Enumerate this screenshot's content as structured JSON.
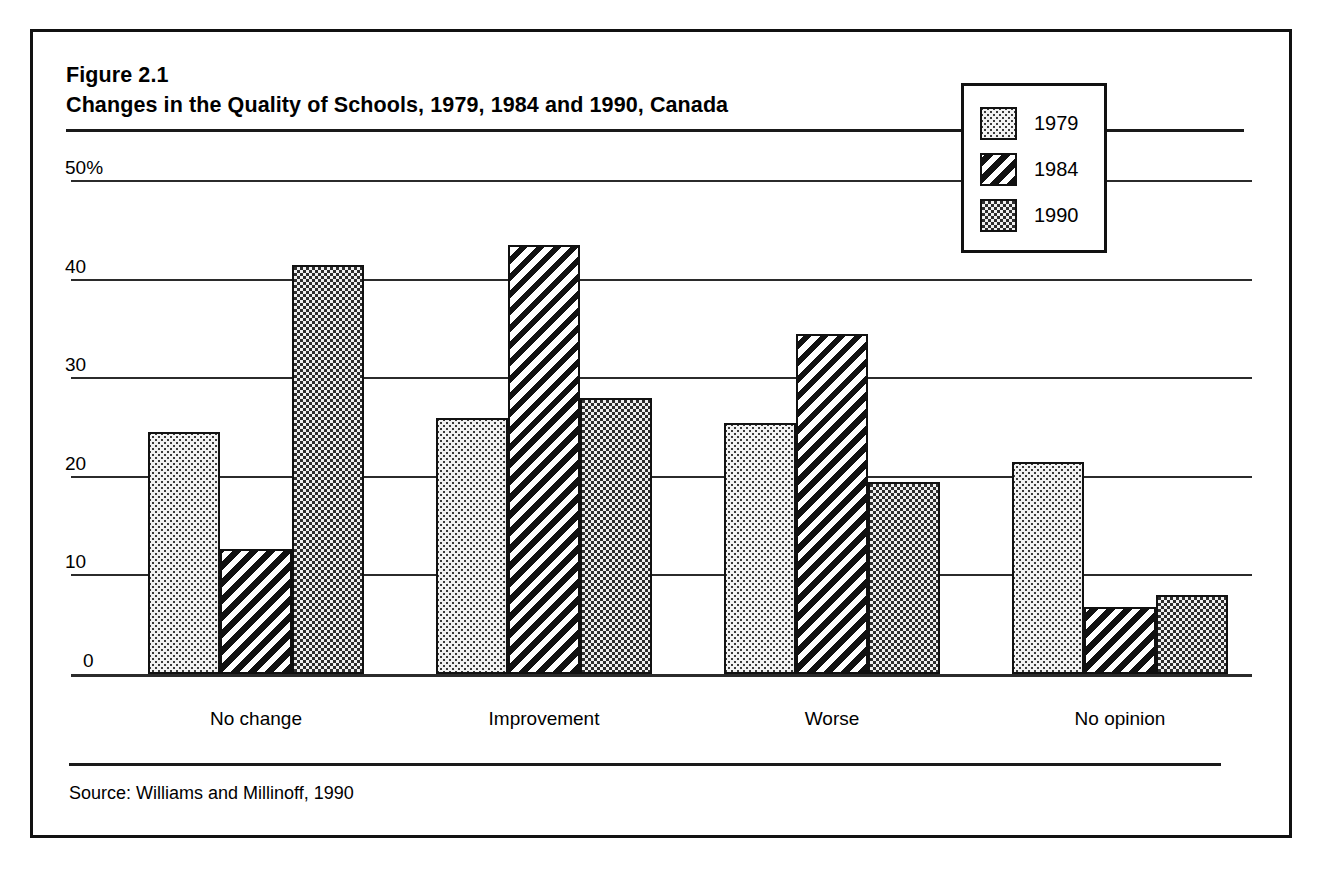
{
  "figure": {
    "number_label": "Figure 2.1",
    "title": "Changes in the Quality of Schools, 1979, 1984 and 1990, Canada",
    "source": "Source: Williams and Millinoff, 1990"
  },
  "legend": {
    "position": "inside-top-right",
    "entries": [
      {
        "label": "1979",
        "pattern": "light-dots"
      },
      {
        "label": "1984",
        "pattern": "diagonal-hatch"
      },
      {
        "label": "1990",
        "pattern": "dark-checker"
      }
    ]
  },
  "axis": {
    "y_ticks": [
      "50%",
      "40",
      "30",
      "20",
      "10",
      "0"
    ],
    "y_tick_values": [
      50,
      40,
      30,
      20,
      10,
      0
    ],
    "x_categories": [
      "No change",
      "Improvement",
      "Worse",
      "No opinion"
    ]
  },
  "chart_data": {
    "type": "bar",
    "title": "Changes in the Quality of Schools, 1979, 1984 and 1990, Canada",
    "xlabel": "",
    "ylabel": "",
    "ylim": [
      0,
      50
    ],
    "ytick_labels": [
      "0",
      "10",
      "20",
      "30",
      "40",
      "50%"
    ],
    "yticks": [
      0,
      10,
      20,
      30,
      40,
      50
    ],
    "grid": true,
    "legend_position": "upper right",
    "categories": [
      "No change",
      "Improvement",
      "Worse",
      "No opinion"
    ],
    "series": [
      {
        "name": "1979",
        "pattern": "light-dots",
        "values": [
          24.5,
          26.0,
          25.5,
          21.5
        ]
      },
      {
        "name": "1984",
        "pattern": "diagonal-hatch",
        "values": [
          12.7,
          43.5,
          34.5,
          6.8
        ]
      },
      {
        "name": "1990",
        "pattern": "dark-checker",
        "values": [
          41.5,
          28.0,
          19.5,
          8.0
        ]
      }
    ],
    "units": "percent",
    "source": "Williams and Millinoff, 1990"
  },
  "colors": {
    "frame": "#111111",
    "gridline": "#2b2b2b",
    "text": "#000000",
    "series_1979_fill": "#f2f2f2",
    "series_1984_fill": "#ffffff",
    "series_1990_fill": "#2e2e2e"
  }
}
